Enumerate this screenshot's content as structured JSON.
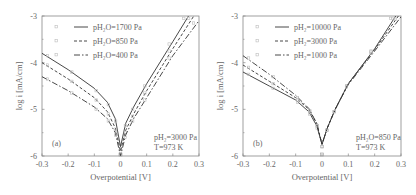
{
  "chart_data": [
    {
      "type": "line",
      "panel_label": "(a)",
      "xlabel": "Overpotential [V]",
      "ylabel": "log i [mA/cm]",
      "xlim": [
        -0.3,
        0.3
      ],
      "ylim": [
        -6,
        -3
      ],
      "xticks": [
        "-0.3",
        "-0.2",
        "-0.1",
        "0",
        "0.1",
        "0.2",
        "0.3"
      ],
      "yticks": [
        "-3",
        "-4",
        "-5",
        "-6"
      ],
      "grid": false,
      "legend_position": "upper-left",
      "annotation": [
        "pH2=3000 Pa",
        "T=973 K"
      ],
      "series": [
        {
          "name": "pH2O=1700 Pa",
          "style": "solid",
          "x": [
            -0.3,
            -0.2,
            -0.1,
            -0.05,
            -0.02,
            0.0,
            0.02,
            0.05,
            0.1,
            0.2,
            0.26
          ],
          "y": [
            -3.8,
            -4.15,
            -4.55,
            -4.85,
            -5.2,
            -5.8,
            -5.3,
            -4.95,
            -4.45,
            -3.55,
            -3.0
          ]
        },
        {
          "name": "pH2O=850 Pa",
          "style": "dashed",
          "x": [
            -0.3,
            -0.2,
            -0.1,
            -0.05,
            -0.02,
            0.0,
            0.02,
            0.05,
            0.1,
            0.2,
            0.28
          ],
          "y": [
            -4.0,
            -4.35,
            -4.75,
            -5.05,
            -5.4,
            -5.9,
            -5.45,
            -5.1,
            -4.6,
            -3.7,
            -3.0
          ]
        },
        {
          "name": "pH2O=400 Pa",
          "style": "dash-dot",
          "x": [
            -0.3,
            -0.2,
            -0.1,
            -0.05,
            -0.02,
            0.0,
            0.02,
            0.05,
            0.1,
            0.2,
            0.3
          ],
          "y": [
            -4.3,
            -4.6,
            -4.95,
            -5.2,
            -5.5,
            -6.0,
            -5.55,
            -5.2,
            -4.75,
            -3.85,
            -3.1
          ]
        }
      ]
    },
    {
      "type": "line",
      "panel_label": "(b)",
      "xlabel": "Overpotential [V]",
      "ylabel": "log i [mA/cm]",
      "xlim": [
        -0.3,
        0.3
      ],
      "ylim": [
        -6,
        -3
      ],
      "xticks": [
        "-0.3",
        "-0.2",
        "-0.1",
        "0",
        "0.1",
        "0.2",
        "0.3"
      ],
      "yticks": [
        "-3",
        "-4",
        "-5",
        "-6"
      ],
      "grid": false,
      "legend_position": "upper-left",
      "annotation": [
        "pH2O=850 Pa",
        "T=973 K"
      ],
      "series": [
        {
          "name": "pH2=10000 Pa",
          "style": "solid",
          "x": [
            -0.3,
            -0.2,
            -0.1,
            -0.05,
            -0.02,
            0.0,
            0.02,
            0.05,
            0.1,
            0.2,
            0.28
          ],
          "y": [
            -4.2,
            -4.5,
            -4.8,
            -5.05,
            -5.35,
            -5.75,
            -5.4,
            -5.0,
            -4.45,
            -3.7,
            -3.0
          ]
        },
        {
          "name": "pH2=3000 Pa",
          "style": "dashed",
          "x": [
            -0.3,
            -0.2,
            -0.1,
            -0.05,
            -0.02,
            0.0,
            0.02,
            0.05,
            0.1,
            0.2,
            0.29
          ],
          "y": [
            -4.05,
            -4.4,
            -4.75,
            -5.0,
            -5.3,
            -5.75,
            -5.4,
            -5.0,
            -4.45,
            -3.72,
            -3.0
          ]
        },
        {
          "name": "pH2=1000 Pa",
          "style": "dash-dot",
          "x": [
            -0.3,
            -0.2,
            -0.1,
            -0.05,
            -0.02,
            0.0,
            0.02,
            0.05,
            0.1,
            0.2,
            0.3
          ],
          "y": [
            -3.85,
            -4.25,
            -4.7,
            -4.98,
            -5.3,
            -5.75,
            -5.4,
            -5.0,
            -4.47,
            -3.75,
            -3.02
          ]
        }
      ]
    }
  ],
  "panels": [
    {
      "label": "(a)",
      "ylabel": "log i [mA/cm]",
      "xlabel": "Overpotential [V]",
      "legend": [
        "pH₂O=1700 Pa",
        "pH₂O=850 Pa",
        "pH₂O=400 Pa"
      ],
      "note_line1": "pH₂=3000 Pa",
      "note_line2": "T=973 K"
    },
    {
      "label": "(b)",
      "ylabel": "log i [mA/cm]",
      "xlabel": "Overpotential [V]",
      "legend": [
        "pH₂=10000 Pa",
        "pH₂=3000 Pa",
        "pH₂=1000 Pa"
      ],
      "note_line1": "pH₂O=850 Pa",
      "note_line2": "T=973 K"
    }
  ],
  "colors": {
    "line": "#333333",
    "frame": "#888888",
    "marker": "#bbbbbb"
  }
}
